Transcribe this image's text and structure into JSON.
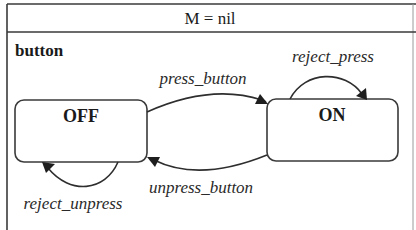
{
  "header": {
    "title": "M = nil"
  },
  "region": {
    "label": "button"
  },
  "states": [
    {
      "id": "off",
      "label": "OFF"
    },
    {
      "id": "on",
      "label": "ON"
    }
  ],
  "transitions": [
    {
      "id": "press_button",
      "label": "press_button",
      "from": "OFF",
      "to": "ON"
    },
    {
      "id": "unpress_button",
      "label": "unpress_button",
      "from": "ON",
      "to": "OFF"
    },
    {
      "id": "reject_press",
      "label": "reject_press",
      "from": "ON",
      "to": "ON"
    },
    {
      "id": "reject_unpress",
      "label": "reject_unpress",
      "from": "OFF",
      "to": "OFF"
    }
  ],
  "colors": {
    "line": "#3a3a3a",
    "text": "#1a1a1a",
    "background": "#ffffff"
  }
}
